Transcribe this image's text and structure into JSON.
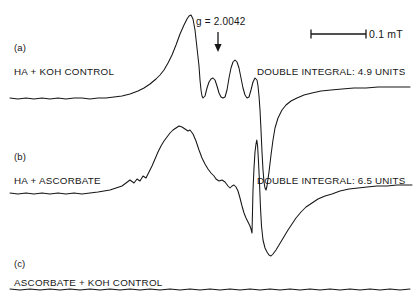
{
  "figure": {
    "type": "epr-spectra",
    "background_color": "#ffffff",
    "trace_color": "#161616"
  },
  "annotations": {
    "g_value": "g = 2.0042",
    "g_marker_icon": "down-arrow-icon",
    "scale_bar_label": "0.1 mT",
    "scale_bar_icon": "scale-bar-icon"
  },
  "panels": [
    {
      "letter": "(a)",
      "sample": "HA + KOH CONTROL",
      "integral": "DOUBLE INTEGRAL: 4.9 UNITS"
    },
    {
      "letter": "(b)",
      "sample": "HA + ASCORBATE",
      "integral": "DOUBLE INTEGRAL: 6.5 UNITS"
    },
    {
      "letter": "(c)",
      "sample": "ASCORBATE + KOH CONTROL",
      "integral": ""
    }
  ],
  "chart_data": {
    "type": "line",
    "title": "",
    "xlabel": "",
    "ylabel": "",
    "grid": false,
    "legend": "none",
    "x_axis_unit": "mT",
    "scale_bar_mT": 0.1,
    "scale_bar_px": 55,
    "g_value": 2.0042,
    "g_marker_x_px": 218,
    "series": [
      {
        "name": "(a) HA + KOH CONTROL",
        "baseline_y_px": 98,
        "double_integral_units": 4.9,
        "description": "First-derivative EPR signal with resolved hyperfine quartet on the low-field side and a sharp deep trough at high field.",
        "points": [
          [
            10,
            98
          ],
          [
            18,
            99
          ],
          [
            26,
            98
          ],
          [
            34,
            99
          ],
          [
            42,
            98
          ],
          [
            50,
            99
          ],
          [
            58,
            98
          ],
          [
            66,
            99
          ],
          [
            74,
            98
          ],
          [
            82,
            98
          ],
          [
            90,
            99
          ],
          [
            98,
            98
          ],
          [
            106,
            98
          ],
          [
            114,
            97
          ],
          [
            122,
            96
          ],
          [
            130,
            94
          ],
          [
            138,
            91
          ],
          [
            144,
            88
          ],
          [
            150,
            84
          ],
          [
            156,
            79
          ],
          [
            160,
            75
          ],
          [
            164,
            70
          ],
          [
            168,
            63
          ],
          [
            172,
            55
          ],
          [
            176,
            45
          ],
          [
            180,
            34
          ],
          [
            184,
            25
          ],
          [
            187,
            19
          ],
          [
            189,
            16
          ],
          [
            191,
            15
          ],
          [
            193,
            19
          ],
          [
            195,
            30
          ],
          [
            197,
            48
          ],
          [
            199,
            66
          ],
          [
            200,
            80
          ],
          [
            201,
            90
          ],
          [
            202,
            96
          ],
          [
            203,
            98
          ],
          [
            205,
            96
          ],
          [
            207,
            88
          ],
          [
            209,
            82
          ],
          [
            211,
            79
          ],
          [
            213,
            78
          ],
          [
            215,
            80
          ],
          [
            217,
            86
          ],
          [
            219,
            93
          ],
          [
            221,
            97
          ],
          [
            223,
            98
          ],
          [
            225,
            97
          ],
          [
            227,
            90
          ],
          [
            229,
            78
          ],
          [
            231,
            68
          ],
          [
            233,
            62
          ],
          [
            235,
            60
          ],
          [
            237,
            62
          ],
          [
            239,
            68
          ],
          [
            241,
            78
          ],
          [
            243,
            88
          ],
          [
            245,
            95
          ],
          [
            247,
            98
          ],
          [
            249,
            97
          ],
          [
            251,
            90
          ],
          [
            253,
            82
          ],
          [
            255,
            78
          ],
          [
            257,
            80
          ],
          [
            258,
            86
          ],
          [
            259,
            96
          ],
          [
            260,
            110
          ],
          [
            261,
            130
          ],
          [
            262,
            152
          ],
          [
            263,
            170
          ],
          [
            264,
            182
          ],
          [
            265,
            188
          ],
          [
            266,
            190
          ],
          [
            267,
            186
          ],
          [
            269,
            172
          ],
          [
            271,
            155
          ],
          [
            273,
            140
          ],
          [
            275,
            128
          ],
          [
            278,
            118
          ],
          [
            282,
            110
          ],
          [
            286,
            105
          ],
          [
            291,
            101
          ],
          [
            297,
            98
          ],
          [
            304,
            95
          ],
          [
            312,
            93
          ],
          [
            321,
            91
          ],
          [
            331,
            90
          ],
          [
            342,
            89
          ],
          [
            354,
            88
          ],
          [
            366,
            88
          ],
          [
            378,
            87
          ],
          [
            390,
            87
          ],
          [
            402,
            87
          ],
          [
            410,
            87
          ]
        ]
      },
      {
        "name": "(b) HA + ASCORBATE",
        "baseline_y_px": 193,
        "double_integral_units": 6.5,
        "description": "Broader, more intense first-derivative EPR signal with a narrow spike at high field and a broad trough.",
        "points": [
          [
            10,
            193
          ],
          [
            18,
            194
          ],
          [
            26,
            193
          ],
          [
            34,
            194
          ],
          [
            42,
            193
          ],
          [
            50,
            194
          ],
          [
            58,
            193
          ],
          [
            66,
            194
          ],
          [
            74,
            193
          ],
          [
            82,
            194
          ],
          [
            90,
            193
          ],
          [
            98,
            192
          ],
          [
            104,
            191
          ],
          [
            110,
            190
          ],
          [
            116,
            188
          ],
          [
            122,
            186
          ],
          [
            126,
            183
          ],
          [
            130,
            180
          ],
          [
            134,
            183
          ],
          [
            137,
            179
          ],
          [
            140,
            181
          ],
          [
            143,
            176
          ],
          [
            146,
            178
          ],
          [
            149,
            172
          ],
          [
            152,
            166
          ],
          [
            155,
            159
          ],
          [
            158,
            152
          ],
          [
            161,
            146
          ],
          [
            164,
            141
          ],
          [
            167,
            137
          ],
          [
            170,
            133
          ],
          [
            173,
            130
          ],
          [
            176,
            128
          ],
          [
            179,
            126
          ],
          [
            182,
            127
          ],
          [
            185,
            129
          ],
          [
            188,
            131
          ],
          [
            190,
            130
          ],
          [
            193,
            134
          ],
          [
            196,
            141
          ],
          [
            199,
            150
          ],
          [
            202,
            158
          ],
          [
            205,
            164
          ],
          [
            208,
            169
          ],
          [
            211,
            173
          ],
          [
            214,
            176
          ],
          [
            216,
            179
          ],
          [
            219,
            181
          ],
          [
            222,
            180
          ],
          [
            225,
            182
          ],
          [
            228,
            186
          ],
          [
            230,
            188
          ],
          [
            232,
            186
          ],
          [
            234,
            185
          ],
          [
            236,
            187
          ],
          [
            238,
            191
          ],
          [
            240,
            198
          ],
          [
            242,
            206
          ],
          [
            244,
            213
          ],
          [
            246,
            218
          ],
          [
            248,
            222
          ],
          [
            250,
            226
          ],
          [
            251,
            229
          ],
          [
            252,
            233
          ],
          [
            253,
            190
          ],
          [
            254,
            168
          ],
          [
            255,
            152
          ],
          [
            256,
            144
          ],
          [
            256.8,
            140
          ],
          [
            257.6,
            146
          ],
          [
            258.4,
            160
          ],
          [
            259.4,
            180
          ],
          [
            260.4,
            206
          ],
          [
            261.5,
            226
          ],
          [
            263,
            240
          ],
          [
            265,
            248
          ],
          [
            267,
            252
          ],
          [
            269,
            255
          ],
          [
            271,
            256
          ],
          [
            273,
            254
          ],
          [
            276,
            250
          ],
          [
            279,
            245
          ],
          [
            282,
            240
          ],
          [
            285,
            235
          ],
          [
            288,
            230
          ],
          [
            292,
            224
          ],
          [
            296,
            218
          ],
          [
            301,
            212
          ],
          [
            306,
            207
          ],
          [
            312,
            203
          ],
          [
            318,
            199
          ],
          [
            325,
            196
          ],
          [
            332,
            194
          ],
          [
            340,
            191
          ],
          [
            349,
            189
          ],
          [
            358,
            188
          ],
          [
            367,
            187
          ],
          [
            377,
            186
          ],
          [
            387,
            186
          ],
          [
            397,
            185
          ],
          [
            406,
            185
          ],
          [
            412,
            185
          ]
        ]
      },
      {
        "name": "(c) ASCORBATE + KOH CONTROL",
        "baseline_y_px": 289,
        "double_integral_units": null,
        "description": "Flat baseline, no detectable EPR signal.",
        "points": [
          [
            10,
            289
          ],
          [
            20,
            290
          ],
          [
            30,
            289
          ],
          [
            40,
            290
          ],
          [
            50,
            289
          ],
          [
            60,
            290
          ],
          [
            70,
            289
          ],
          [
            80,
            290
          ],
          [
            90,
            289
          ],
          [
            100,
            290
          ],
          [
            110,
            289
          ],
          [
            120,
            290
          ],
          [
            130,
            289
          ],
          [
            140,
            290
          ],
          [
            150,
            289
          ],
          [
            160,
            290
          ],
          [
            170,
            289
          ],
          [
            180,
            290
          ],
          [
            190,
            289
          ],
          [
            200,
            290
          ],
          [
            210,
            289
          ],
          [
            220,
            290
          ],
          [
            230,
            289
          ],
          [
            240,
            290
          ],
          [
            250,
            289
          ],
          [
            260,
            290
          ],
          [
            270,
            289
          ],
          [
            280,
            290
          ],
          [
            290,
            289
          ],
          [
            300,
            290
          ],
          [
            310,
            289
          ],
          [
            320,
            290
          ],
          [
            330,
            289
          ],
          [
            340,
            290
          ],
          [
            350,
            289
          ],
          [
            360,
            290
          ],
          [
            370,
            289
          ],
          [
            380,
            290
          ],
          [
            390,
            289
          ],
          [
            400,
            290
          ],
          [
            410,
            289
          ]
        ]
      }
    ]
  }
}
